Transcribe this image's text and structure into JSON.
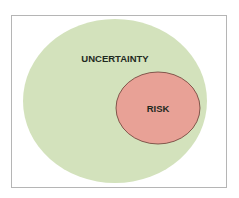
{
  "diagram": {
    "type": "nested-ellipses",
    "outer": {
      "label": "UNCERTAINTY",
      "color": "#d3e2bc"
    },
    "inner": {
      "label": "RISK",
      "color": "#e8a196",
      "stroke": "#6b3a33"
    },
    "frame_border": "#b5b5b5"
  }
}
